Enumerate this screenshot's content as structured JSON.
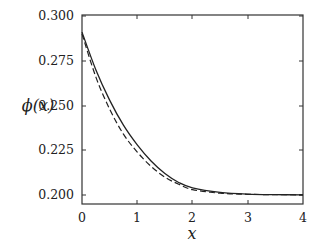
{
  "chart_data": {
    "type": "line",
    "title": "",
    "xlabel": "x",
    "ylabel": "ϕ(x)",
    "xlim": [
      0,
      4
    ],
    "ylim": [
      0.195,
      0.3
    ],
    "grid": false,
    "legend": null,
    "x_ticks": [
      "0",
      "1",
      "2",
      "3",
      "4"
    ],
    "y_ticks": [
      "0.200",
      "0.225",
      "0.250",
      "0.275",
      "0.300"
    ],
    "series": [
      {
        "name": "solid",
        "style": "solid",
        "x": [
          0,
          0.25,
          0.5,
          0.75,
          1.0,
          1.25,
          1.5,
          1.75,
          2.0,
          2.5,
          3.0,
          3.5,
          4.0
        ],
        "values": [
          0.291,
          0.27,
          0.253,
          0.239,
          0.228,
          0.219,
          0.212,
          0.207,
          0.204,
          0.2015,
          0.2005,
          0.2002,
          0.2001
        ]
      },
      {
        "name": "dashed",
        "style": "dashed",
        "x": [
          0,
          0.25,
          0.5,
          0.75,
          1.0,
          1.25,
          1.5,
          1.75,
          2.0,
          2.5,
          3.0,
          3.5,
          4.0
        ],
        "values": [
          0.29,
          0.266,
          0.248,
          0.234,
          0.224,
          0.216,
          0.21,
          0.206,
          0.203,
          0.201,
          0.2004,
          0.2002,
          0.2001
        ]
      }
    ]
  },
  "labels": {
    "ylabel": "ϕ(x)",
    "xlabel": "x",
    "x_ticks": [
      "0",
      "1",
      "2",
      "3",
      "4"
    ],
    "y_ticks": [
      "0.300",
      "0.275",
      "0.250",
      "0.225",
      "0.200"
    ]
  }
}
